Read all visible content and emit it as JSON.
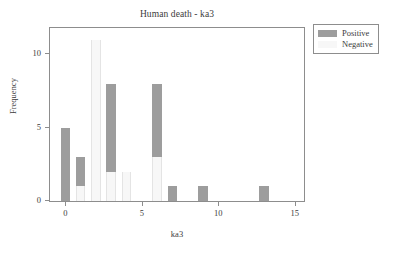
{
  "chart_data": {
    "type": "bar",
    "subtype": "stacked-histogram",
    "title": "Human death - ka3",
    "xlabel": "ka3",
    "ylabel": "Frequency",
    "xlim": [
      -1.0,
      15.6
    ],
    "ylim": [
      0,
      11.8
    ],
    "xticks": [
      0,
      5,
      10,
      15
    ],
    "xtick_labels": [
      "0",
      "5",
      "10",
      "15"
    ],
    "yticks": [
      0,
      5,
      10
    ],
    "ytick_labels": [
      "0",
      "5",
      "10"
    ],
    "grid": false,
    "legend_position": "outside-top-right",
    "bar_width": 0.62,
    "categories": [
      0,
      1,
      2,
      3,
      4,
      6,
      7,
      9,
      13
    ],
    "series": [
      {
        "name": "Positive",
        "color": "#9d9d9d",
        "values": [
          5,
          2,
          0,
          6,
          0,
          5,
          1,
          1,
          1
        ]
      },
      {
        "name": "Negative",
        "color": "#f7f7f7",
        "values": [
          0,
          1,
          11,
          2,
          2,
          3,
          0,
          0,
          0
        ]
      }
    ],
    "totals": [
      5,
      3,
      11,
      8,
      2,
      8,
      1,
      1,
      1
    ],
    "annotations": []
  },
  "legend": {
    "entries": [
      {
        "label": "Positive",
        "swatch": "positive"
      },
      {
        "label": "Negative",
        "swatch": "negative"
      }
    ]
  },
  "colors": {
    "positive": "#9d9d9d",
    "negative": "#f7f7f7",
    "axis": "#8d8d8d",
    "text": "#3c3c3c",
    "background": "#ffffff"
  }
}
